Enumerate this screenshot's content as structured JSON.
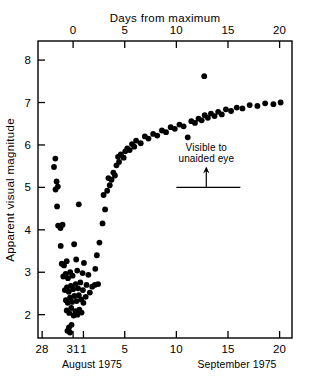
{
  "chart_data": {
    "type": "scatter",
    "title": "",
    "xlabel": "Days from maximum",
    "ylabel": "Apparent visual magnitude",
    "xlim": [
      -3.4,
      21.2
    ],
    "ylim": [
      8.45,
      1.45
    ],
    "y_inverted": true,
    "grid": false,
    "legend": null,
    "top_axis": {
      "label": "Days from maximum",
      "ticks": [
        0,
        5,
        10,
        15,
        20
      ],
      "tick_labels": [
        "0",
        "5",
        "10",
        "15",
        "20"
      ]
    },
    "bottom_axis": {
      "ticks": [
        -3,
        0,
        1,
        5,
        10,
        15,
        20
      ],
      "tick_labels": [
        "28",
        "31",
        "1",
        "5",
        "10",
        "15",
        "20"
      ],
      "group_labels": [
        "August 1975",
        "September 1975"
      ]
    },
    "y_axis": {
      "ticks": [
        2,
        3,
        4,
        5,
        6,
        7,
        8
      ],
      "tick_labels": [
        "2",
        "3",
        "4",
        "5",
        "6",
        "7",
        "8"
      ]
    },
    "annotations": [
      {
        "text_line1": "Visible to",
        "text_line2": "unaided eye",
        "arrow_x": 12.9,
        "line_y": 5.0,
        "line_x_start": 10.0,
        "line_x_end": 16.2
      }
    ],
    "marker": {
      "shape": "circle",
      "color": "#000000",
      "size": 3.4
    },
    "points": [
      {
        "x": -0.55,
        "y": 1.62
      },
      {
        "x": -0.4,
        "y": 1.7
      },
      {
        "x": -0.3,
        "y": 1.58
      },
      {
        "x": -0.15,
        "y": 1.76
      },
      {
        "x": -0.62,
        "y": 2.1
      },
      {
        "x": -0.38,
        "y": 2.04
      },
      {
        "x": -0.18,
        "y": 2.16
      },
      {
        "x": 0.05,
        "y": 1.98
      },
      {
        "x": 0.22,
        "y": 2.08
      },
      {
        "x": 0.42,
        "y": 2.0
      },
      {
        "x": 0.6,
        "y": 2.12
      },
      {
        "x": 0.82,
        "y": 2.05
      },
      {
        "x": -0.7,
        "y": 2.34
      },
      {
        "x": -0.52,
        "y": 2.28
      },
      {
        "x": -0.3,
        "y": 2.4
      },
      {
        "x": -0.1,
        "y": 2.3
      },
      {
        "x": 0.12,
        "y": 2.44
      },
      {
        "x": 0.34,
        "y": 2.32
      },
      {
        "x": 0.55,
        "y": 2.46
      },
      {
        "x": 0.78,
        "y": 2.36
      },
      {
        "x": 1.0,
        "y": 2.28
      },
      {
        "x": 1.22,
        "y": 2.42
      },
      {
        "x": -0.8,
        "y": 2.58
      },
      {
        "x": -0.6,
        "y": 2.64
      },
      {
        "x": -0.42,
        "y": 2.54
      },
      {
        "x": -0.22,
        "y": 2.68
      },
      {
        "x": 0.0,
        "y": 2.6
      },
      {
        "x": 0.25,
        "y": 2.72
      },
      {
        "x": 0.48,
        "y": 2.62
      },
      {
        "x": 0.7,
        "y": 2.76
      },
      {
        "x": 0.95,
        "y": 2.58
      },
      {
        "x": 1.3,
        "y": 2.7
      },
      {
        "x": 1.62,
        "y": 2.52
      },
      {
        "x": 1.85,
        "y": 2.66
      },
      {
        "x": -0.95,
        "y": 2.9
      },
      {
        "x": -0.72,
        "y": 2.96
      },
      {
        "x": -0.5,
        "y": 2.86
      },
      {
        "x": -0.28,
        "y": 3.0
      },
      {
        "x": -0.05,
        "y": 2.92
      },
      {
        "x": 0.4,
        "y": 3.04
      },
      {
        "x": 0.92,
        "y": 2.98
      },
      {
        "x": 1.48,
        "y": 2.94
      },
      {
        "x": 2.1,
        "y": 2.7
      },
      {
        "x": 2.42,
        "y": 2.72
      },
      {
        "x": 2.15,
        "y": 3.08
      },
      {
        "x": -1.1,
        "y": 3.2
      },
      {
        "x": -0.88,
        "y": 3.16
      },
      {
        "x": -0.62,
        "y": 3.26
      },
      {
        "x": 0.3,
        "y": 3.3
      },
      {
        "x": 1.05,
        "y": 3.22
      },
      {
        "x": 2.3,
        "y": 3.4
      },
      {
        "x": -1.2,
        "y": 3.62
      },
      {
        "x": 0.1,
        "y": 3.66
      },
      {
        "x": 2.55,
        "y": 3.7
      },
      {
        "x": -1.45,
        "y": 4.1
      },
      {
        "x": -1.22,
        "y": 4.04
      },
      {
        "x": -1.02,
        "y": 4.12
      },
      {
        "x": 2.85,
        "y": 4.15
      },
      {
        "x": -1.55,
        "y": 4.55
      },
      {
        "x": 0.55,
        "y": 4.6
      },
      {
        "x": 3.1,
        "y": 4.48
      },
      {
        "x": -1.7,
        "y": 4.95
      },
      {
        "x": -1.48,
        "y": 5.02
      },
      {
        "x": -1.6,
        "y": 5.14
      },
      {
        "x": 2.95,
        "y": 4.82
      },
      {
        "x": 3.3,
        "y": 4.92
      },
      {
        "x": 3.55,
        "y": 5.05
      },
      {
        "x": 3.42,
        "y": 5.22
      },
      {
        "x": 3.72,
        "y": 5.18
      },
      {
        "x": 3.9,
        "y": 5.35
      },
      {
        "x": 4.05,
        "y": 5.28
      },
      {
        "x": -1.85,
        "y": 5.48
      },
      {
        "x": -1.72,
        "y": 5.68
      },
      {
        "x": 4.2,
        "y": 5.52
      },
      {
        "x": 4.45,
        "y": 5.6
      },
      {
        "x": 4.35,
        "y": 5.72
      },
      {
        "x": 4.62,
        "y": 5.78
      },
      {
        "x": 4.9,
        "y": 5.7
      },
      {
        "x": 5.05,
        "y": 5.85
      },
      {
        "x": 5.25,
        "y": 5.92
      },
      {
        "x": 5.48,
        "y": 5.88
      },
      {
        "x": 5.7,
        "y": 6.02
      },
      {
        "x": 5.92,
        "y": 5.96
      },
      {
        "x": 6.1,
        "y": 6.1
      },
      {
        "x": 6.55,
        "y": 6.04
      },
      {
        "x": 6.95,
        "y": 6.2
      },
      {
        "x": 7.3,
        "y": 6.15
      },
      {
        "x": 7.75,
        "y": 6.26
      },
      {
        "x": 8.15,
        "y": 6.22
      },
      {
        "x": 8.6,
        "y": 6.34
      },
      {
        "x": 9.0,
        "y": 6.3
      },
      {
        "x": 9.45,
        "y": 6.42
      },
      {
        "x": 9.85,
        "y": 6.38
      },
      {
        "x": 10.3,
        "y": 6.48
      },
      {
        "x": 10.7,
        "y": 6.44
      },
      {
        "x": 11.1,
        "y": 6.18
      },
      {
        "x": 11.45,
        "y": 6.56
      },
      {
        "x": 11.8,
        "y": 6.52
      },
      {
        "x": 12.15,
        "y": 6.62
      },
      {
        "x": 12.45,
        "y": 6.58
      },
      {
        "x": 12.75,
        "y": 6.7
      },
      {
        "x": 13.05,
        "y": 6.64
      },
      {
        "x": 13.35,
        "y": 6.74
      },
      {
        "x": 13.7,
        "y": 6.68
      },
      {
        "x": 14.05,
        "y": 6.78
      },
      {
        "x": 14.4,
        "y": 6.72
      },
      {
        "x": 14.8,
        "y": 6.84
      },
      {
        "x": 15.3,
        "y": 6.8
      },
      {
        "x": 15.85,
        "y": 6.88
      },
      {
        "x": 16.4,
        "y": 6.86
      },
      {
        "x": 17.1,
        "y": 6.94
      },
      {
        "x": 17.85,
        "y": 6.92
      },
      {
        "x": 18.6,
        "y": 6.98
      },
      {
        "x": 19.4,
        "y": 6.96
      },
      {
        "x": 20.1,
        "y": 7.0
      },
      {
        "x": 12.7,
        "y": 7.62
      }
    ]
  }
}
